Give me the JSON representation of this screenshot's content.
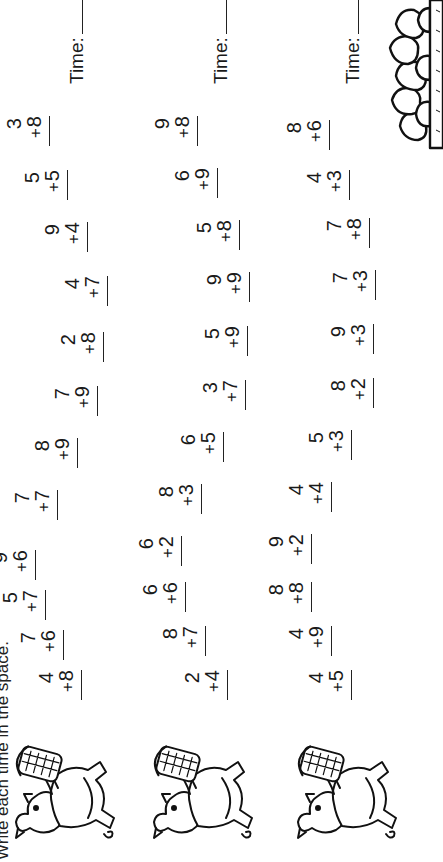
{
  "worksheet": {
    "instructions": "Write each time in the space.",
    "time_label": "Time:",
    "operator": "+",
    "rows": [
      {
        "illustration": "pig-with-basket-icon",
        "problems": [
          {
            "top": "4",
            "bottom": "8"
          },
          {
            "top": "7",
            "bottom": "6"
          },
          {
            "top": "5",
            "bottom": "7"
          },
          {
            "top": "9",
            "bottom": "6"
          },
          {
            "top": "7",
            "bottom": "7"
          },
          {
            "top": "8",
            "bottom": "9"
          },
          {
            "top": "7",
            "bottom": "9"
          },
          {
            "top": "2",
            "bottom": "8"
          },
          {
            "top": "4",
            "bottom": "7"
          },
          {
            "top": "9",
            "bottom": "4"
          },
          {
            "top": "5",
            "bottom": "5"
          },
          {
            "top": "3",
            "bottom": "8"
          }
        ]
      },
      {
        "illustration": "pig-with-basket-icon",
        "problems": [
          {
            "top": "2",
            "bottom": "4"
          },
          {
            "top": "8",
            "bottom": "7"
          },
          {
            "top": "6",
            "bottom": "6"
          },
          {
            "top": "6",
            "bottom": "2"
          },
          {
            "top": "8",
            "bottom": "3"
          },
          {
            "top": "6",
            "bottom": "5"
          },
          {
            "top": "3",
            "bottom": "7"
          },
          {
            "top": "5",
            "bottom": "9"
          },
          {
            "top": "9",
            "bottom": "9"
          },
          {
            "top": "5",
            "bottom": "8"
          },
          {
            "top": "6",
            "bottom": "9"
          },
          {
            "top": "9",
            "bottom": "8"
          }
        ]
      },
      {
        "illustration": "pig-with-basket-icon",
        "problems": [
          {
            "top": "4",
            "bottom": "5"
          },
          {
            "top": "4",
            "bottom": "9"
          },
          {
            "top": "8",
            "bottom": "8"
          },
          {
            "top": "9",
            "bottom": "2"
          },
          {
            "top": "4",
            "bottom": "4"
          },
          {
            "top": "5",
            "bottom": "3"
          },
          {
            "top": "8",
            "bottom": "2"
          },
          {
            "top": "9",
            "bottom": "3"
          },
          {
            "top": "7",
            "bottom": "3"
          },
          {
            "top": "7",
            "bottom": "8"
          },
          {
            "top": "4",
            "bottom": "3"
          },
          {
            "top": "8",
            "bottom": "6"
          }
        ]
      }
    ],
    "decoration": "stone-wall-icon"
  }
}
